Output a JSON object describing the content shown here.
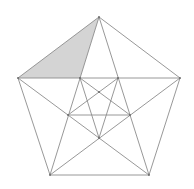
{
  "diagram": {
    "title": "",
    "type": "pentagon-with-inscribed-star-construction",
    "colors": {
      "background": "#ffffff",
      "line": "#8c8c8c",
      "shade": "#d4d4d4",
      "point": "#666666"
    },
    "points": {
      "T": [
        99,
        17
      ],
      "L": [
        18,
        78
      ],
      "R": [
        180,
        78
      ],
      "BL": [
        50,
        175
      ],
      "BR": [
        149,
        175
      ],
      "P1": [
        80,
        78
      ],
      "P2": [
        118,
        78
      ],
      "C": [
        99,
        92
      ],
      "P3": [
        68,
        115
      ],
      "P4": [
        130,
        115
      ],
      "P5": [
        99,
        138
      ]
    },
    "shaded_polygon": [
      "T",
      "L",
      "P1"
    ],
    "segments": [
      [
        "T",
        "L"
      ],
      [
        "T",
        "R"
      ],
      [
        "R",
        "BR"
      ],
      [
        "BR",
        "BL"
      ],
      [
        "BL",
        "L"
      ],
      [
        "L",
        "R"
      ],
      [
        "T",
        "BL"
      ],
      [
        "T",
        "BR"
      ],
      [
        "L",
        "BR"
      ],
      [
        "R",
        "BL"
      ],
      [
        "P1",
        "P4"
      ],
      [
        "P2",
        "P3"
      ],
      [
        "P3",
        "P4"
      ],
      [
        "P1",
        "P5"
      ],
      [
        "P2",
        "P5"
      ]
    ]
  }
}
